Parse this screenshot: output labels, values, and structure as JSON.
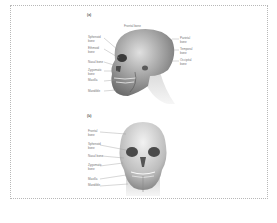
{
  "figure": {
    "panels": [
      {
        "id": "a",
        "marker": "(a)",
        "view": "lateral",
        "labels": {
          "top": "Frontal bone",
          "left": [
            "Sphenoid\nbone",
            "Ethmoid\nbone",
            "Nasal bone",
            "Zygomatic\nbone",
            "Maxilla",
            "Mandible"
          ],
          "right": [
            "Parietal\nbone",
            "Temporal\nbone",
            "Occipital\nbone"
          ]
        }
      },
      {
        "id": "b",
        "marker": "(b)",
        "view": "anterior",
        "labels": {
          "left": [
            "Frontal\nbone",
            "Sphenoid\nbone",
            "Nasal bone",
            "Zygomatic\nbone",
            "Maxilla",
            "Mandible"
          ]
        }
      }
    ]
  }
}
